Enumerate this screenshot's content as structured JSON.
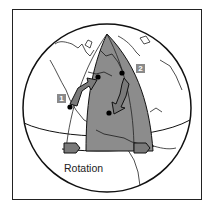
{
  "diagram": {
    "labels": {
      "marker_1": "1",
      "marker_2": "2",
      "rotation": "Rotation"
    },
    "colors": {
      "frame": "#222222",
      "globe_outline": "#111111",
      "wedge_fill": "#8c8c8c",
      "wedge_fill_light": "#a6a6a6",
      "arrow_fill": "#7a7a7a",
      "label_box": "#8a8a8a",
      "coastline": "#222222"
    }
  }
}
